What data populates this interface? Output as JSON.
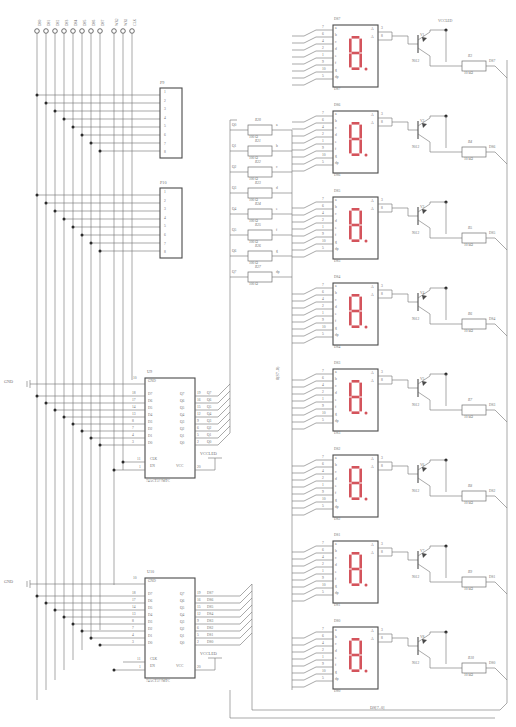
{
  "sheet": {
    "title_block": "DS[7..0]",
    "bus_label_vertical": "8(S7..0)",
    "gnd_label": "GND",
    "vcc_led_label": "VCCLED",
    "vcc_label": "VCC"
  },
  "top_terminals": {
    "group_a": [
      "DS0",
      "DS1",
      "DS2",
      "DS3",
      "DS4",
      "DS5",
      "DS6",
      "DS7"
    ],
    "group_b": [
      "WR2",
      "WR1",
      "CLK"
    ]
  },
  "connectors": [
    {
      "ref": "P9",
      "pins": [
        "1",
        "2",
        "3",
        "4",
        "5",
        "6",
        "7",
        "8"
      ]
    },
    {
      "ref": "P10",
      "pins": [
        "1",
        "2",
        "3",
        "4",
        "5",
        "6",
        "7",
        "8"
      ]
    }
  ],
  "ics": [
    {
      "ref": "U9",
      "part": "74ACT377MTC",
      "gnd_pin": "10",
      "gnd_label": "GND",
      "vcc_pin": "20",
      "vcc_label": "VCC",
      "vcc_net": "VCCLED",
      "clk_pin": "11",
      "en_pin": "1",
      "clk_label": "CLK",
      "en_label": "EN",
      "inputs": [
        {
          "pin": "18",
          "name": "D7"
        },
        {
          "pin": "17",
          "name": "D6"
        },
        {
          "pin": "14",
          "name": "D5"
        },
        {
          "pin": "13",
          "name": "D4"
        },
        {
          "pin": "8",
          "name": "D3"
        },
        {
          "pin": "7",
          "name": "D2"
        },
        {
          "pin": "4",
          "name": "D1"
        },
        {
          "pin": "3",
          "name": "D0"
        }
      ],
      "outputs": [
        {
          "pin": "19",
          "name": "Q7",
          "net": "Q7"
        },
        {
          "pin": "16",
          "name": "Q6",
          "net": "Q6"
        },
        {
          "pin": "15",
          "name": "Q5",
          "net": "Q5"
        },
        {
          "pin": "12",
          "name": "Q4",
          "net": "Q4"
        },
        {
          "pin": "9",
          "name": "Q3",
          "net": "Q3"
        },
        {
          "pin": "6",
          "name": "Q2",
          "net": "Q2"
        },
        {
          "pin": "5",
          "name": "Q1",
          "net": "Q1"
        },
        {
          "pin": "2",
          "name": "Q0",
          "net": "Q0"
        }
      ]
    },
    {
      "ref": "U10",
      "part": "74ACT377MTC",
      "gnd_pin": "10",
      "gnd_label": "GND",
      "vcc_pin": "20",
      "vcc_label": "VCC",
      "vcc_net": "VCCLED",
      "clk_pin": "11",
      "en_pin": "1",
      "clk_label": "CLK",
      "en_label": "EN",
      "inputs": [
        {
          "pin": "18",
          "name": "D7"
        },
        {
          "pin": "17",
          "name": "D6"
        },
        {
          "pin": "14",
          "name": "D5"
        },
        {
          "pin": "13",
          "name": "D4"
        },
        {
          "pin": "8",
          "name": "D3"
        },
        {
          "pin": "7",
          "name": "D2"
        },
        {
          "pin": "4",
          "name": "D1"
        },
        {
          "pin": "3",
          "name": "D0"
        }
      ],
      "outputs": [
        {
          "pin": "19",
          "name": "Q7",
          "net": "DS7"
        },
        {
          "pin": "16",
          "name": "Q6",
          "net": "DS6"
        },
        {
          "pin": "15",
          "name": "Q5",
          "net": "DS5"
        },
        {
          "pin": "12",
          "name": "Q4",
          "net": "DS4"
        },
        {
          "pin": "9",
          "name": "Q3",
          "net": "DS3"
        },
        {
          "pin": "6",
          "name": "Q2",
          "net": "DS2"
        },
        {
          "pin": "5",
          "name": "Q1",
          "net": "DS1"
        },
        {
          "pin": "2",
          "name": "Q0",
          "net": "DS0"
        }
      ]
    }
  ],
  "segment_resistors": [
    {
      "ref": "R20",
      "value": "100 Ω",
      "in": "Q0",
      "out": "a"
    },
    {
      "ref": "R21",
      "value": "100 Ω",
      "in": "Q1",
      "out": "b"
    },
    {
      "ref": "R22",
      "value": "100 Ω",
      "in": "Q2",
      "out": "c"
    },
    {
      "ref": "R23",
      "value": "100 Ω",
      "in": "Q3",
      "out": "d"
    },
    {
      "ref": "R24",
      "value": "100 Ω",
      "in": "Q4",
      "out": "e"
    },
    {
      "ref": "R25",
      "value": "100 Ω",
      "in": "Q5",
      "out": "f"
    },
    {
      "ref": "R26",
      "value": "100 Ω",
      "in": "Q6",
      "out": "g"
    },
    {
      "ref": "R27",
      "value": "100 Ω",
      "in": "Q7",
      "out": "dp"
    }
  ],
  "displays": [
    {
      "ref": "DS7",
      "seg_pins": [
        [
          "a",
          "7"
        ],
        [
          "b",
          "6"
        ],
        [
          "c",
          "4"
        ],
        [
          "d",
          "2"
        ],
        [
          "e",
          "1"
        ],
        [
          "f",
          "9"
        ],
        [
          "g",
          "10"
        ],
        [
          "dp",
          "5"
        ]
      ],
      "anode_pins": [
        "3",
        "8"
      ],
      "anode_labels": [
        "A",
        "A"
      ]
    },
    {
      "ref": "DS6",
      "seg_pins": [
        [
          "a",
          "7"
        ],
        [
          "b",
          "6"
        ],
        [
          "c",
          "4"
        ],
        [
          "d",
          "2"
        ],
        [
          "e",
          "1"
        ],
        [
          "f",
          "9"
        ],
        [
          "g",
          "10"
        ],
        [
          "dp",
          "5"
        ]
      ],
      "anode_pins": [
        "3",
        "8"
      ],
      "anode_labels": [
        "A",
        "A"
      ]
    },
    {
      "ref": "DS5",
      "seg_pins": [
        [
          "a",
          "7"
        ],
        [
          "b",
          "6"
        ],
        [
          "c",
          "4"
        ],
        [
          "d",
          "2"
        ],
        [
          "e",
          "1"
        ],
        [
          "f",
          "9"
        ],
        [
          "g",
          "10"
        ],
        [
          "dp",
          "5"
        ]
      ],
      "anode_pins": [
        "3",
        "8"
      ],
      "anode_labels": [
        "A",
        "A"
      ]
    },
    {
      "ref": "DS4",
      "seg_pins": [
        [
          "a",
          "7"
        ],
        [
          "b",
          "6"
        ],
        [
          "c",
          "4"
        ],
        [
          "d",
          "2"
        ],
        [
          "e",
          "1"
        ],
        [
          "f",
          "9"
        ],
        [
          "g",
          "10"
        ],
        [
          "dp",
          "5"
        ]
      ],
      "anode_pins": [
        "3",
        "8"
      ],
      "anode_labels": [
        "A",
        "A"
      ]
    },
    {
      "ref": "DS3",
      "seg_pins": [
        [
          "a",
          "7"
        ],
        [
          "b",
          "6"
        ],
        [
          "c",
          "4"
        ],
        [
          "d",
          "2"
        ],
        [
          "e",
          "1"
        ],
        [
          "f",
          "9"
        ],
        [
          "g",
          "10"
        ],
        [
          "dp",
          "5"
        ]
      ],
      "anode_pins": [
        "3",
        "8"
      ],
      "anode_labels": [
        "A",
        "A"
      ]
    },
    {
      "ref": "DS2",
      "seg_pins": [
        [
          "a",
          "7"
        ],
        [
          "b",
          "6"
        ],
        [
          "c",
          "4"
        ],
        [
          "d",
          "2"
        ],
        [
          "e",
          "1"
        ],
        [
          "f",
          "9"
        ],
        [
          "g",
          "10"
        ],
        [
          "dp",
          "5"
        ]
      ],
      "anode_pins": [
        "3",
        "8"
      ],
      "anode_labels": [
        "A",
        "A"
      ]
    },
    {
      "ref": "DS1",
      "seg_pins": [
        [
          "a",
          "7"
        ],
        [
          "b",
          "6"
        ],
        [
          "c",
          "4"
        ],
        [
          "d",
          "2"
        ],
        [
          "e",
          "1"
        ],
        [
          "f",
          "9"
        ],
        [
          "g",
          "10"
        ],
        [
          "dp",
          "5"
        ]
      ],
      "anode_pins": [
        "3",
        "8"
      ],
      "anode_labels": [
        "A",
        "A"
      ]
    },
    {
      "ref": "DS0",
      "seg_pins": [
        [
          "a",
          "7"
        ],
        [
          "b",
          "6"
        ],
        [
          "c",
          "4"
        ],
        [
          "d",
          "2"
        ],
        [
          "e",
          "1"
        ],
        [
          "f",
          "9"
        ],
        [
          "g",
          "10"
        ],
        [
          "dp",
          "5"
        ]
      ],
      "anode_pins": [
        "3",
        "8"
      ],
      "anode_labels": [
        "A",
        "A"
      ]
    }
  ],
  "transistors": [
    {
      "ref": "V1",
      "part": "9012",
      "base_res": "R3",
      "base_val": "10 kΩ",
      "net": "DS7"
    },
    {
      "ref": "V2",
      "part": "9012",
      "base_res": "R4",
      "base_val": "10 kΩ",
      "net": "DS6"
    },
    {
      "ref": "V3",
      "part": "9012",
      "base_res": "R5",
      "base_val": "10 kΩ",
      "net": "DS5"
    },
    {
      "ref": "V4",
      "part": "9012",
      "base_res": "R6",
      "base_val": "10 kΩ",
      "net": "DS4"
    },
    {
      "ref": "V5",
      "part": "9012",
      "base_res": "R7",
      "base_val": "10 kΩ",
      "net": "DS3"
    },
    {
      "ref": "V6",
      "part": "9012",
      "base_res": "R8",
      "base_val": "10 kΩ",
      "net": "DS2"
    },
    {
      "ref": "V7",
      "part": "9012",
      "base_res": "R9",
      "base_val": "10 kΩ",
      "net": "DS1"
    },
    {
      "ref": "V8",
      "part": "9012",
      "base_res": "R10",
      "base_val": "10 kΩ",
      "net": "DS0"
    }
  ],
  "display_labels_under": [
    "DS7",
    "DS6",
    "DS5",
    "DS4",
    "DS3",
    "DS2",
    "DS1",
    "DS0"
  ]
}
